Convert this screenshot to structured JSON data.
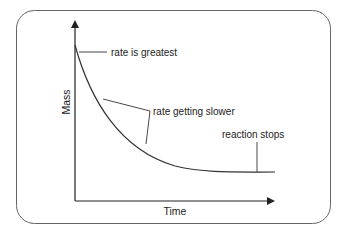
{
  "diagram": {
    "type": "mass-time-reaction-curve",
    "colors": {
      "frame": "#555555",
      "lines": "#333333",
      "text": "#222222",
      "background": "#ffffff"
    },
    "axes": {
      "y_label": "Mass",
      "x_label": "Time"
    },
    "annotations": [
      {
        "id": "start",
        "text": "rate is greatest"
      },
      {
        "id": "middle",
        "text": "rate getting slower"
      },
      {
        "id": "end",
        "text": "reaction stops"
      }
    ]
  }
}
